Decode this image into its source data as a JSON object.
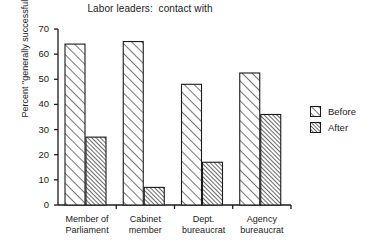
{
  "chart_data": {
    "type": "bar",
    "title": "Labor leaders:  contact with",
    "xlabel": "",
    "ylabel": "Percent \"generally successful\"",
    "ylim": [
      0,
      70
    ],
    "yticks": [
      0,
      10,
      20,
      30,
      40,
      50,
      60,
      70
    ],
    "ytick_labels": [
      "0",
      "10",
      "20",
      "30",
      "40",
      "50",
      "60",
      "70"
    ],
    "grid": false,
    "legend_position": "right",
    "categories": [
      "Member of\nParliament",
      "Cabinet\nmember",
      "Dept.\nbureaucrat",
      "Agency\nbureaucrat"
    ],
    "series": [
      {
        "name": "Before",
        "values": [
          64,
          65,
          48,
          52.5
        ],
        "pattern": "diagonal-hatch-wide"
      },
      {
        "name": "After",
        "values": [
          27,
          7,
          17,
          36
        ],
        "pattern": "diagonal-hatch-dense"
      }
    ]
  },
  "legend": {
    "items": [
      {
        "label": "Before"
      },
      {
        "label": "After"
      }
    ]
  },
  "colors": {
    "ink": "#1a1a1a",
    "background": "#ffffff",
    "bar_fill": "#ffffff",
    "bar_stroke": "#1a1a1a"
  }
}
